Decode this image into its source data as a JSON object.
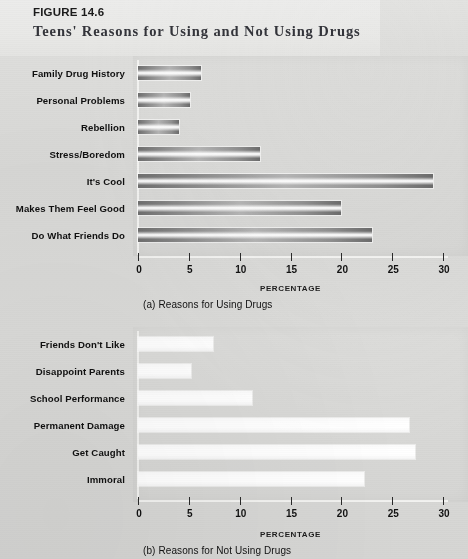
{
  "header": {
    "figure_number": "FIGURE 14.6",
    "title": "Teens' Reasons for Using and Not Using Drugs"
  },
  "chart_data": [
    {
      "type": "bar",
      "orientation": "horizontal",
      "id": "chart-a",
      "title": "",
      "caption": "(a) Reasons for Using Drugs",
      "xlabel": "PERCENTAGE",
      "ylabel": "",
      "xlim": [
        0,
        30
      ],
      "xticks": [
        "0",
        "5",
        "10",
        "15",
        "20",
        "25",
        "30"
      ],
      "grid": false,
      "legend": "none",
      "categories": [
        "Family Drug History",
        "Personal Problems",
        "Rebellion",
        "Stress/Boredom",
        "It's Cool",
        "Makes Them Feel Good",
        "Do What Friends Do"
      ],
      "values": [
        6.2,
        5.1,
        4.0,
        12.0,
        29.0,
        20.0,
        23.0
      ]
    },
    {
      "type": "bar",
      "orientation": "horizontal",
      "id": "chart-b",
      "title": "",
      "caption": "(b) Reasons for Not Using Drugs",
      "xlabel": "PERCENTAGE",
      "ylabel": "",
      "xlim": [
        0,
        30
      ],
      "xticks": [
        "0",
        "5",
        "10",
        "15",
        "20",
        "25",
        "30"
      ],
      "grid": false,
      "legend": "none",
      "categories": [
        "Friends Don't Like",
        "Disappoint Parents",
        "School Performance",
        "Permanent Damage",
        "Get Caught",
        "Immoral"
      ],
      "values": [
        7.4,
        5.2,
        11.2,
        26.6,
        27.2,
        22.2
      ]
    }
  ]
}
